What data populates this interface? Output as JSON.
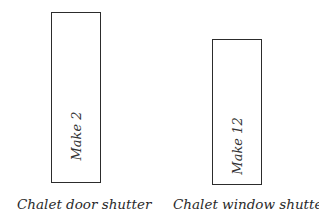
{
  "diagram": {
    "items": [
      {
        "label": "Chalet door shutter",
        "instruction": "Make 2",
        "rect": {
          "x": 51,
          "y": 12,
          "w": 50,
          "h": 171
        },
        "text_center_y": 135,
        "caption_pos": {
          "x": 17,
          "y": 196
        }
      },
      {
        "label": "Chalet window shutter",
        "instruction": "Make 12",
        "rect": {
          "x": 212,
          "y": 39,
          "w": 50,
          "h": 146
        },
        "text_center_y": 145,
        "caption_pos": {
          "x": 173,
          "y": 196
        }
      }
    ],
    "stroke_color": "#2c2c2c",
    "background": "#ffffff"
  }
}
